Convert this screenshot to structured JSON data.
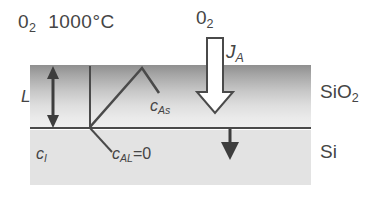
{
  "figure": {
    "labels": {
      "ambient": "0₂ 1000°C",
      "ambient_species": "0",
      "ambient_species_sub": "2",
      "ambient_temperature": "1000°C",
      "gas_species": "0",
      "gas_species_sub": "2",
      "flux": "J",
      "flux_sub": "A",
      "thickness": "L",
      "c_surface": "c",
      "c_surface_sub": "As",
      "c_interstitial": "c",
      "c_interstitial_sub": "I",
      "c_interface": "c",
      "c_interface_sub": "AL",
      "c_interface_value": "=0",
      "oxide_layer": "SiO",
      "oxide_layer_sub": "2",
      "substrate_layer": "Si"
    },
    "colors": {
      "oxide_top": "#8f8f8f",
      "oxide_bottom": "#efefef",
      "silicon_fill": "#e3e3e3",
      "line": "#4a4a4a",
      "text": "#454545",
      "arrow_fill": "#ffffff",
      "background": "#ffffff"
    },
    "geometry": {
      "oxide_top_y": 65,
      "interface_y": 128,
      "substrate_bottom_y": 185,
      "block_left_x": 30,
      "block_right_x": 311
    }
  }
}
